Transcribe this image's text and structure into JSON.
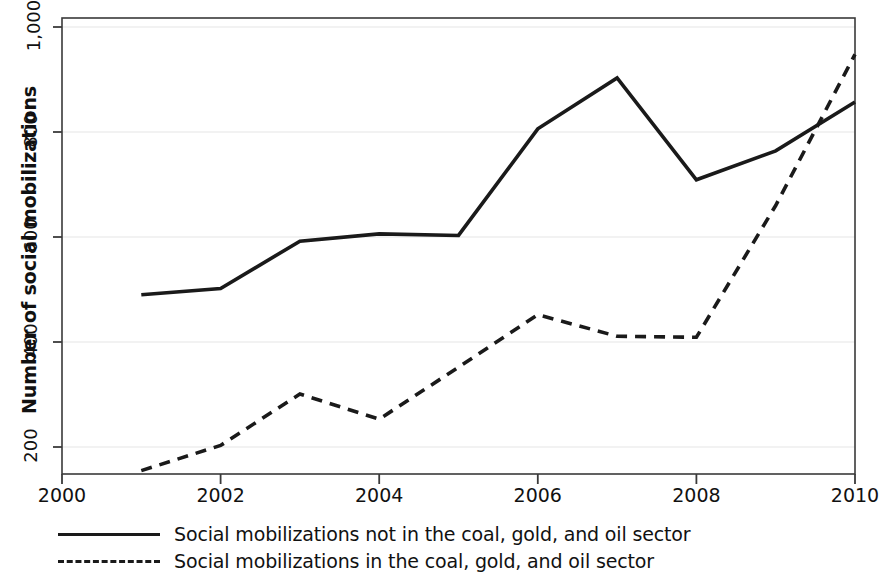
{
  "chart_data": {
    "type": "line",
    "title": "",
    "xlabel": "",
    "ylabel": "Number of social mobilizations",
    "x": [
      2001,
      2002,
      2003,
      2004,
      2005,
      2006,
      2007,
      2008,
      2009,
      2010
    ],
    "xlim": [
      2000,
      2010
    ],
    "ylim": [
      130,
      1015
    ],
    "xticks": [
      "2000",
      "2002",
      "2004",
      "2006",
      "2008",
      "2010"
    ],
    "xtick_values": [
      2000,
      2002,
      2004,
      2006,
      2008,
      2010
    ],
    "yticks": [
      "200",
      "400",
      "600",
      "800",
      "1,000"
    ],
    "ytick_values": [
      200,
      400,
      600,
      800,
      1000
    ],
    "grid": "horizontal",
    "legend_position": "below",
    "series": [
      {
        "name": "Social mobilizations not in the coal, gold, and oil sector",
        "style": "solid",
        "color": "#1a1a1a",
        "values": [
          490,
          502,
          592,
          606,
          603,
          806,
          903,
          709,
          764,
          857
        ]
      },
      {
        "name": "Social mobilizations in the coal, gold, and oil sector",
        "style": "dashed",
        "color": "#1a1a1a",
        "values": [
          155,
          203,
          301,
          253,
          352,
          452,
          411,
          409,
          660,
          948
        ]
      }
    ]
  },
  "legend": {
    "items": [
      {
        "label": "Social mobilizations not in the coal, gold, and oil sector",
        "style": "solid"
      },
      {
        "label": "Social mobilizations in the coal, gold, and oil sector",
        "style": "dashed"
      }
    ]
  }
}
